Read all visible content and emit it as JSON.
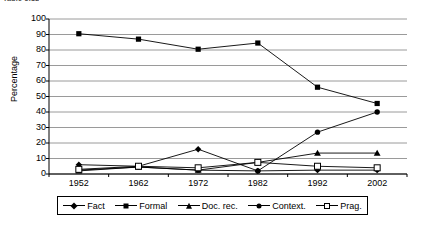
{
  "caption": {
    "text": "Table 5.12"
  },
  "chart_data": {
    "type": "line",
    "title": "",
    "subtitle": "",
    "xlabel": "",
    "ylabel": "Percentage",
    "categories": [
      "1952",
      "1962",
      "1972",
      "1982",
      "1992",
      "2002"
    ],
    "x": [
      1952,
      1962,
      1972,
      1982,
      1992,
      2002
    ],
    "ylim": [
      0,
      100
    ],
    "y_ticks": [
      0,
      10,
      20,
      30,
      40,
      50,
      60,
      70,
      80,
      90,
      100
    ],
    "y_tick_labels": [
      "0",
      "10",
      "20",
      "30",
      "40",
      "50",
      "60",
      "70",
      "80",
      "90",
      "100"
    ],
    "grid": "horizontal",
    "legend_position": "bottom",
    "series": [
      {
        "name": "Fact",
        "marker": "diamond",
        "values": [
          6,
          5,
          16,
          2,
          2.5,
          2.5
        ]
      },
      {
        "name": "Formal",
        "marker": "square",
        "values": [
          90.5,
          87,
          80.5,
          84.5,
          56,
          45.5
        ]
      },
      {
        "name": "Doc. rec.",
        "marker": "triangle",
        "values": [
          2,
          4.5,
          2.5,
          7.5,
          13.5,
          13.5
        ]
      },
      {
        "name": "Context.",
        "marker": "circle",
        "values": [
          2.5,
          4.5,
          2.5,
          2,
          27,
          40
        ]
      },
      {
        "name": "Prag.",
        "marker": "open-square",
        "values": [
          3,
          5,
          4,
          7.5,
          5,
          4
        ]
      }
    ]
  },
  "legend": {
    "items": [
      {
        "label": "Fact",
        "marker": "diamond"
      },
      {
        "label": "Formal",
        "marker": "square"
      },
      {
        "label": "Doc. rec.",
        "marker": "triangle"
      },
      {
        "label": "Context.",
        "marker": "circle"
      },
      {
        "label": "Prag.",
        "marker": "open-square"
      }
    ]
  },
  "colors": {
    "line": "#000000",
    "grid": "#808080",
    "axis": "#000000",
    "background": "#ffffff"
  }
}
